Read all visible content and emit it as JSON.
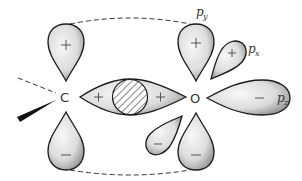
{
  "diagram": {
    "type": "molecular-orbital-sketch",
    "atoms": [
      {
        "id": "C",
        "label": "C",
        "x": 66,
        "y": 97
      },
      {
        "id": "O",
        "label": "O",
        "x": 196,
        "y": 98
      }
    ],
    "sigma_bond": {
      "between": [
        "C",
        "O"
      ],
      "signs": [
        "+",
        "+"
      ],
      "overlap_region": "hatched"
    },
    "orbital_labels": {
      "py": {
        "base": "p",
        "sub": "y"
      },
      "px": {
        "base": "p",
        "sub": "x"
      },
      "pz": {
        "base": "p",
        "sub": "z"
      }
    },
    "lobe_signs": {
      "c_py_upper": "+",
      "c_py_lower": "−",
      "o_py_upper": "+",
      "o_py_lower": "−",
      "o_px_upper": "+",
      "o_px_lower": "−",
      "o_pz": "−",
      "sigma_c_side": "+",
      "sigma_o_side": "+"
    },
    "colors": {
      "ink": "#1a1a1a",
      "fill_light": "#f2f2f2",
      "fill_dark": "#9a9a9a",
      "background": "#ffffff"
    }
  }
}
